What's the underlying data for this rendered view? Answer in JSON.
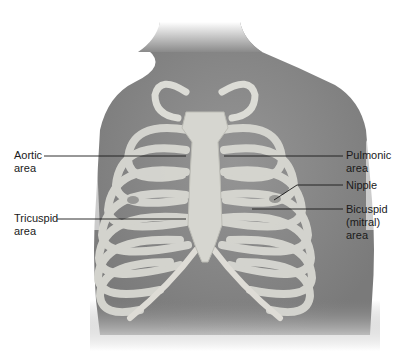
{
  "figure": {
    "colors": {
      "skin": "#8c8c8c",
      "bone": "#d9d9d4",
      "line": "#1a1a1a",
      "background": "#ffffff"
    }
  },
  "labels": {
    "aortic": {
      "line1": "Aortic",
      "line2": "area"
    },
    "tricuspid": {
      "line1": "Tricuspid",
      "line2": "area"
    },
    "pulmonic": {
      "line1": "Pulmonic",
      "line2": "area"
    },
    "nipple": {
      "line1": "Nipple"
    },
    "bicuspid": {
      "line1": "Bicuspid",
      "line2": "(mitral)",
      "line3": "area"
    }
  }
}
